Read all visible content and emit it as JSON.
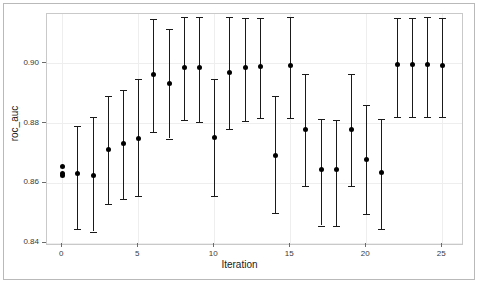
{
  "chart_data": {
    "type": "scatter",
    "title": "",
    "subtitle": "",
    "xlabel": "Iteration",
    "ylabel": "roc_auc",
    "xlim": [
      -1.0,
      26.3
    ],
    "ylim": [
      0.8395,
      0.9165
    ],
    "grid": true,
    "legend": null,
    "xticks": [
      0,
      5,
      10,
      15,
      20,
      25
    ],
    "xtick_labels": [
      "0",
      "5",
      "10",
      "15",
      "20",
      "25"
    ],
    "yticks": [
      0.84,
      0.86,
      0.88,
      0.9
    ],
    "ytick_labels": [
      "0.84",
      "0.86",
      "0.88",
      "0.90"
    ],
    "marker": "filled-circle",
    "marker_color": "#000000",
    "errorbar_color": "#1a1a1a",
    "x": [
      0,
      0,
      0,
      1,
      2,
      3,
      4,
      5,
      6,
      7,
      8,
      9,
      10,
      11,
      12,
      13,
      14,
      15,
      16,
      17,
      18,
      19,
      20,
      21,
      22,
      23,
      24,
      25
    ],
    "values": [
      0.8655,
      0.8632,
      0.8625,
      0.8632,
      0.8625,
      0.871,
      0.8731,
      0.875,
      0.8961,
      0.8932,
      0.8986,
      0.8985,
      0.8751,
      0.897,
      0.8986,
      0.8991,
      0.869,
      0.8992,
      0.8779,
      0.8645,
      0.8644,
      0.8779,
      0.8677,
      0.8633,
      0.8995,
      0.8995,
      0.8996,
      0.8992
    ],
    "err_low": [
      0.8655,
      0.8632,
      0.8625,
      0.8445,
      0.8437,
      0.853,
      0.8547,
      0.8557,
      0.877,
      0.8748,
      0.881,
      0.8803,
      0.8556,
      0.8779,
      0.8806,
      0.8818,
      0.8498,
      0.8818,
      0.8589,
      0.8457,
      0.8455,
      0.8589,
      0.8496,
      0.8444,
      0.8821,
      0.882,
      0.8821,
      0.882
    ],
    "err_high": [
      0.8655,
      0.8632,
      0.8625,
      0.879,
      0.8819,
      0.889,
      0.891,
      0.8948,
      0.9148,
      0.9114,
      0.9156,
      0.9155,
      0.8948,
      0.9155,
      0.9153,
      0.9152,
      0.889,
      0.9155,
      0.8964,
      0.8813,
      0.8811,
      0.8964,
      0.8862,
      0.8812,
      0.9152,
      0.9153,
      0.9154,
      0.9152
    ]
  },
  "axes": {
    "xlabel": "Iteration",
    "ylabel": "roc_auc"
  }
}
